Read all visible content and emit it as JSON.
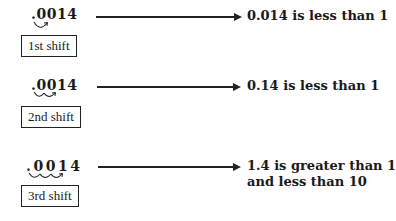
{
  "rows": [
    {
      "number": ".0014",
      "number_display": {
        "prefix": ".",
        "digits": [
          "0",
          "0",
          "1",
          "4"
        ]
      },
      "shifts": 1,
      "label": "1st shift",
      "result": "0.014 is less than 1",
      "result_line2": ""
    },
    {
      "number": ".0014",
      "number_display": {
        "prefix": ".",
        "digits": [
          "0",
          "0",
          "1",
          "4"
        ]
      },
      "shifts": 2,
      "label": "2nd shift",
      "result": "0.14 is less than 1",
      "result_line2": ""
    },
    {
      "number": ".0014",
      "number_display": {
        "prefix": ".",
        "digits": [
          "0",
          "0",
          "1",
          "4"
        ]
      },
      "shifts": 3,
      "label": "3rd shift",
      "result": "1.4 is greater than 1",
      "result_line2": "and less than 10"
    }
  ],
  "colors": {
    "ink": "#1a1a1a",
    "line": "#222222",
    "background": "#ffffff"
  }
}
